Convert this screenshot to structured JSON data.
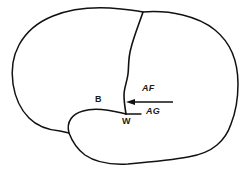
{
  "figure": {
    "name": "lateral-brain-language-areas-diagram",
    "type": "line-drawing",
    "background_color": "#ffffff",
    "stroke_color": "#111111"
  },
  "structures": {
    "cortex_outline": "brain-lateral-outline",
    "central_sulcus": "central-sulcus-line",
    "lateral_fissure": "lateral-sylvian-fissure-line",
    "temporal_lobe": "temporal-lobe-outline"
  },
  "annotations": {
    "broca": {
      "label": "B",
      "name": "label-broca-area"
    },
    "wernicke": {
      "label": "W",
      "name": "label-wernicke-area"
    },
    "arcuate_fasciculus": {
      "label": "AF",
      "name": "label-arcuate-fasciculus"
    },
    "angular_gyrus": {
      "label": "AG",
      "name": "label-angular-gyrus"
    }
  },
  "arrow": {
    "name": "arcuate-fasciculus-arrow",
    "direction": "left",
    "from_x": 173,
    "to_x": 126,
    "y": 102
  }
}
